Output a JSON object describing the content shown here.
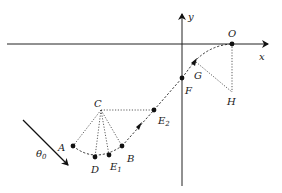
{
  "diagram": {
    "axes": {
      "x_label": "x",
      "y_label": "y"
    },
    "angle_label": {
      "symbol": "θ",
      "sub": "0"
    },
    "points": {
      "O": "O",
      "C": "C",
      "A": "A",
      "B": "B",
      "D": "D",
      "E1": {
        "main": "E",
        "sub": "1"
      },
      "E2": {
        "main": "E",
        "sub": "2"
      },
      "F": "F",
      "G": "G",
      "H": "H"
    },
    "colors": {
      "ink": "#111111",
      "background": "#ffffff"
    }
  }
}
